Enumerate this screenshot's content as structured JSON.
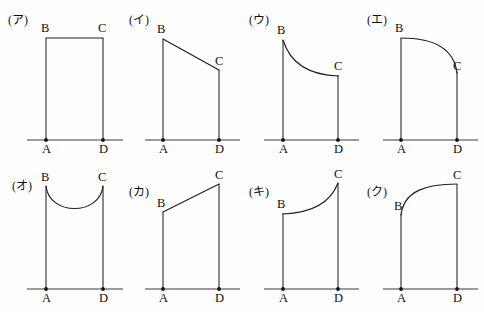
{
  "sheet": {
    "title": "Eight shape diagrams labelled A B C D",
    "background_color": "#fefefe",
    "ink_color": "#1a1a1a",
    "width": 484,
    "height": 312
  },
  "labels": {
    "a": "A",
    "b": "B",
    "c": "C",
    "d": "D"
  },
  "panels": [
    {
      "id": "panel-a",
      "tag": "(ア)",
      "tag_x": 8,
      "tag_y": 24,
      "shape": "rectangle",
      "description": "B and C level, flat straight top",
      "baseline_x1": 27,
      "baseline_x2": 123,
      "baseline_y": 140,
      "ax": 46,
      "dx": 103,
      "by": 38,
      "cy": 38,
      "top_path": "M 46 38 L 103 38",
      "b_label_x": 41,
      "b_label_y": 32,
      "c_label_x": 98,
      "c_label_y": 32,
      "a_label_x": 42,
      "a_label_y": 153,
      "d_label_x": 99,
      "d_label_y": 153
    },
    {
      "id": "panel-i",
      "tag": "(イ)",
      "tag_x": 129,
      "tag_y": 24,
      "shape": "straight-decreasing",
      "description": "Straight line falling from high B to lower C",
      "baseline_x1": 145,
      "baseline_x2": 240,
      "baseline_y": 140,
      "ax": 163,
      "dx": 219,
      "by": 39,
      "cy": 70,
      "top_path": "M 163 39 L 219 70",
      "b_label_x": 157,
      "b_label_y": 33,
      "c_label_x": 215,
      "c_label_y": 65,
      "a_label_x": 159,
      "a_label_y": 153,
      "d_label_x": 215,
      "d_label_y": 153
    },
    {
      "id": "panel-u",
      "tag": "(ウ)",
      "tag_x": 249,
      "tag_y": 24,
      "shape": "convex-decreasing",
      "description": "Decreasing curve, steep at B then flattening toward C",
      "baseline_x1": 264,
      "baseline_x2": 359,
      "baseline_y": 140,
      "ax": 283,
      "dx": 338,
      "by": 40,
      "cy": 75,
      "top_path": "M 283 40 C 291 66, 312 75, 338 76",
      "b_label_x": 277,
      "b_label_y": 34,
      "c_label_x": 334,
      "c_label_y": 70,
      "a_label_x": 279,
      "a_label_y": 153,
      "d_label_x": 334,
      "d_label_y": 153
    },
    {
      "id": "panel-e",
      "tag": "(エ)",
      "tag_x": 367,
      "tag_y": 24,
      "shape": "concave-decreasing",
      "description": "Quarter circle: flat at B then dropping steeply to C",
      "baseline_x1": 383,
      "baseline_x2": 478,
      "baseline_y": 140,
      "ax": 401,
      "dx": 457,
      "by": 38,
      "cy": 72,
      "top_path": "M 401 38 C 432 38, 454 48, 457 73",
      "b_label_x": 395,
      "b_label_y": 32,
      "c_label_x": 453,
      "c_label_y": 70,
      "a_label_x": 397,
      "a_label_y": 153,
      "d_label_x": 453,
      "d_label_y": 153
    },
    {
      "id": "panel-o",
      "tag": "(オ)",
      "tag_x": 12,
      "tag_y": 190,
      "shape": "u-shaped-dip",
      "description": "B and C level, curve sags down in the middle",
      "baseline_x1": 27,
      "baseline_x2": 123,
      "baseline_y": 289,
      "ax": 46,
      "dx": 103,
      "by": 186,
      "cy": 186,
      "top_path": "M 46 186 C 49 216, 100 216, 103 186",
      "b_label_x": 41,
      "b_label_y": 181,
      "c_label_x": 98,
      "c_label_y": 181,
      "a_label_x": 42,
      "a_label_y": 302,
      "d_label_x": 99,
      "d_label_y": 302
    },
    {
      "id": "panel-ka",
      "tag": "(カ)",
      "tag_x": 129,
      "tag_y": 196,
      "shape": "straight-increasing",
      "description": "Straight line rising from low B to high C",
      "baseline_x1": 145,
      "baseline_x2": 240,
      "baseline_y": 289,
      "ax": 163,
      "dx": 219,
      "by": 212,
      "cy": 184,
      "top_path": "M 163 212 L 219 184",
      "b_label_x": 157,
      "b_label_y": 207,
      "c_label_x": 215,
      "c_label_y": 179,
      "a_label_x": 159,
      "a_label_y": 302,
      "d_label_x": 215,
      "d_label_y": 302
    },
    {
      "id": "panel-ki",
      "tag": "(キ)",
      "tag_x": 249,
      "tag_y": 196,
      "shape": "convex-increasing",
      "description": "Increasing curve, flat at B then rising steeply to C",
      "baseline_x1": 264,
      "baseline_x2": 359,
      "baseline_y": 289,
      "ax": 283,
      "dx": 338,
      "by": 213,
      "cy": 183,
      "top_path": "M 283 214 C 309 213, 330 204, 338 183",
      "b_label_x": 277,
      "b_label_y": 208,
      "c_label_x": 334,
      "c_label_y": 178,
      "a_label_x": 279,
      "a_label_y": 302,
      "d_label_x": 334,
      "d_label_y": 302
    },
    {
      "id": "panel-ku",
      "tag": "(ク)",
      "tag_x": 367,
      "tag_y": 196,
      "shape": "concave-increasing",
      "description": "Increasing curve, steep at B then flattening toward C",
      "baseline_x1": 383,
      "baseline_x2": 478,
      "baseline_y": 289,
      "ax": 401,
      "dx": 457,
      "by": 214,
      "cy": 184,
      "top_path": "M 401 215 C 404 190, 428 184, 457 184",
      "b_label_x": 394,
      "b_label_y": 210,
      "c_label_x": 453,
      "c_label_y": 179,
      "a_label_x": 397,
      "a_label_y": 302,
      "d_label_x": 453,
      "d_label_y": 302
    }
  ]
}
